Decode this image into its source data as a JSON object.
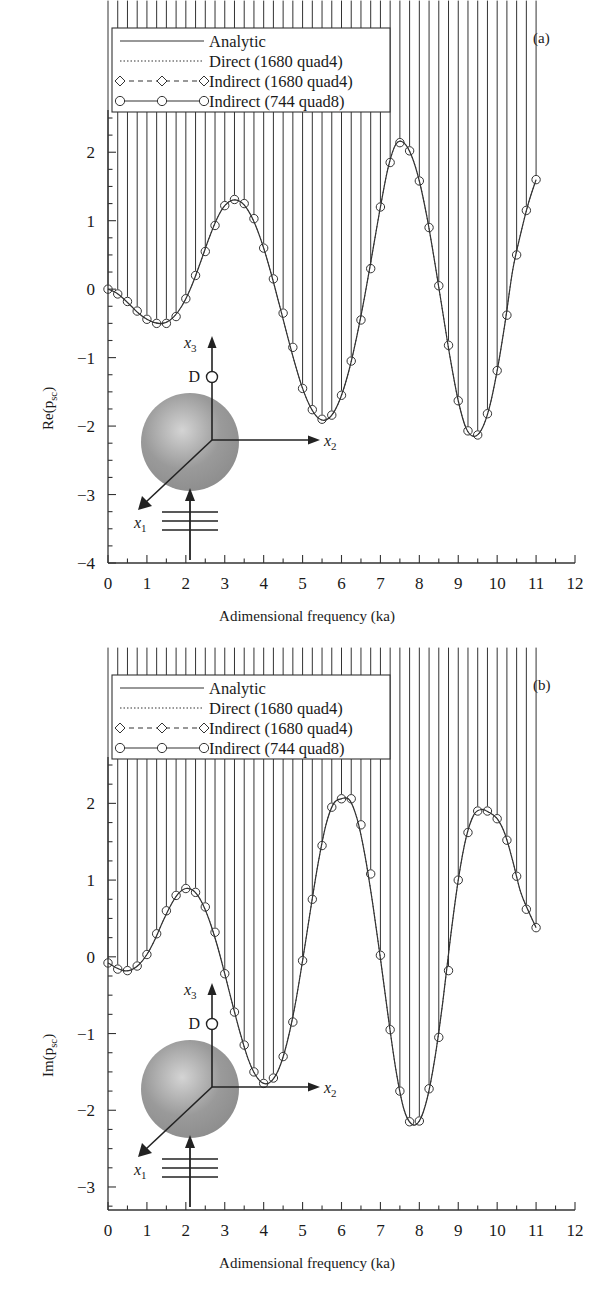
{
  "figure": {
    "panels": [
      {
        "id": "a",
        "label": "(a)",
        "ylabel_prefix": "Re(p",
        "ylabel_sub": "sc",
        "ylabel_suffix": ")",
        "xlabel": "Adimensional frequency (ka)"
      },
      {
        "id": "b",
        "label": "(b)",
        "ylabel_prefix": "Im(p",
        "ylabel_sub": "sc",
        "ylabel_suffix": ")",
        "xlabel": "Adimensional frequency (ka)"
      }
    ]
  },
  "legend": {
    "entries": [
      {
        "label": "Analytic",
        "style": "solid",
        "marker": "none",
        "color": "#333333"
      },
      {
        "label": "Direct (1680 quad4)",
        "style": "dotted",
        "marker": "none",
        "color": "#333333"
      },
      {
        "label": "Indirect (1680 quad4)",
        "style": "dashed",
        "marker": "diamond",
        "color": "#333333"
      },
      {
        "label": "Indirect (744 quad8)",
        "style": "solid",
        "marker": "circle",
        "color": "#333333"
      }
    ]
  },
  "inset": {
    "axis_x1_prefix": "x",
    "axis_x1_sub": "1",
    "axis_x2_prefix": "x",
    "axis_x2_sub": "2",
    "axis_x3_prefix": "x",
    "axis_x3_sub": "3",
    "point_label": "D",
    "sphere_fill": "#9a9a9a",
    "sphere_highlight": "#d4d4d4"
  },
  "chart_data": [
    {
      "type": "line",
      "panel": "a",
      "title": "",
      "xlabel": "Adimensional frequency (ka)",
      "ylabel": "Re(p_sc)",
      "xlim": [
        0,
        12
      ],
      "ylim": [
        -4,
        2.5
      ],
      "xticks": [
        0,
        1,
        2,
        3,
        4,
        5,
        6,
        7,
        8,
        9,
        10,
        11,
        12
      ],
      "yticks": [
        2,
        1,
        0,
        -1,
        -2,
        -3,
        -4
      ],
      "minor_tick_x": 0.5,
      "minor_tick_y": 0.25,
      "grid": false,
      "legend_position": "top-left",
      "series": [
        {
          "name": "Analytic",
          "x": [
            0,
            0.2,
            0.4,
            0.6,
            0.8,
            1.0,
            1.2,
            1.4,
            1.6,
            1.8,
            2.0,
            2.2,
            2.4,
            2.6,
            2.8,
            3.0,
            3.2,
            3.4,
            3.6,
            3.8,
            4.0,
            4.2,
            4.4,
            4.6,
            4.8,
            5.0,
            5.2,
            5.4,
            5.6,
            5.8,
            6.0,
            6.2,
            6.4,
            6.6,
            6.8,
            7.0,
            7.2,
            7.4,
            7.6,
            7.8,
            8.0,
            8.2,
            8.4,
            8.6,
            8.8,
            9.0,
            9.2,
            9.4,
            9.6,
            9.8,
            10.0,
            10.2,
            10.4,
            10.6,
            10.8,
            11.0
          ],
          "y": [
            0.0,
            -0.05,
            -0.14,
            -0.25,
            -0.36,
            -0.44,
            -0.49,
            -0.5,
            -0.45,
            -0.33,
            -0.14,
            0.12,
            0.43,
            0.75,
            1.03,
            1.22,
            1.3,
            1.28,
            1.15,
            0.92,
            0.6,
            0.21,
            -0.22,
            -0.66,
            -1.08,
            -1.45,
            -1.72,
            -1.88,
            -1.91,
            -1.8,
            -1.55,
            -1.17,
            -0.67,
            -0.09,
            0.55,
            1.2,
            1.78,
            2.12,
            2.14,
            1.95,
            1.58,
            1.04,
            0.38,
            -0.33,
            -1.03,
            -1.63,
            -2.03,
            -2.15,
            -2.05,
            -1.73,
            -1.19,
            -0.5,
            0.28,
            0.8,
            1.25,
            1.6
          ]
        },
        {
          "name": "Indirect (1680 quad4)",
          "marker": "diamond",
          "x": [
            0,
            0.25,
            0.5,
            0.75,
            1.0,
            1.25,
            1.5,
            1.75,
            2.0,
            2.25,
            2.5,
            2.75,
            3.0,
            3.25,
            3.5,
            3.75,
            4.0,
            4.25,
            4.5,
            4.75,
            5.0,
            5.25,
            5.5,
            5.75,
            6.0,
            6.25,
            6.5,
            6.75,
            7.0,
            7.25,
            7.5,
            7.75,
            8.0,
            8.25,
            8.5,
            8.75,
            9.0,
            9.25,
            9.5,
            9.75,
            10.0,
            10.25,
            10.5,
            10.75,
            11.0
          ],
          "y": [
            0.0,
            -0.07,
            -0.18,
            -0.32,
            -0.44,
            -0.5,
            -0.5,
            -0.4,
            -0.14,
            0.2,
            0.55,
            0.93,
            1.22,
            1.31,
            1.25,
            1.03,
            0.6,
            0.15,
            -0.35,
            -0.85,
            -1.45,
            -1.76,
            -1.9,
            -1.84,
            -1.55,
            -1.05,
            -0.45,
            0.3,
            1.2,
            1.85,
            2.14,
            2.02,
            1.58,
            0.9,
            0.05,
            -0.82,
            -1.63,
            -2.07,
            -2.13,
            -1.82,
            -1.19,
            -0.38,
            0.5,
            1.15,
            1.6
          ]
        },
        {
          "name": "Indirect (744 quad8)",
          "marker": "circle",
          "x": [
            0,
            0.25,
            0.5,
            0.75,
            1.0,
            1.25,
            1.5,
            1.75,
            2.0,
            2.25,
            2.5,
            2.75,
            3.0,
            3.25,
            3.5,
            3.75,
            4.0,
            4.25,
            4.5,
            4.75,
            5.0,
            5.25,
            5.5,
            5.75,
            6.0,
            6.25,
            6.5,
            6.75,
            7.0,
            7.25,
            7.5,
            7.75,
            8.0,
            8.25,
            8.5,
            8.75,
            9.0,
            9.25,
            9.5,
            9.75,
            10.0,
            10.25,
            10.5,
            10.75,
            11.0
          ],
          "y": [
            0.0,
            -0.07,
            -0.18,
            -0.32,
            -0.44,
            -0.5,
            -0.5,
            -0.4,
            -0.14,
            0.2,
            0.55,
            0.93,
            1.22,
            1.31,
            1.25,
            1.03,
            0.6,
            0.15,
            -0.35,
            -0.85,
            -1.45,
            -1.76,
            -1.9,
            -1.84,
            -1.55,
            -1.05,
            -0.45,
            0.3,
            1.2,
            1.85,
            2.14,
            2.02,
            1.58,
            0.9,
            0.05,
            -0.82,
            -1.63,
            -2.07,
            -2.13,
            -1.82,
            -1.19,
            -0.38,
            0.5,
            1.15,
            1.6
          ]
        }
      ]
    },
    {
      "type": "line",
      "panel": "b",
      "title": "",
      "xlabel": "Adimensional frequency (ka)",
      "ylabel": "Im(p_sc)",
      "xlim": [
        0,
        12
      ],
      "ylim": [
        -3.3,
        2.5
      ],
      "xticks": [
        0,
        1,
        2,
        3,
        4,
        5,
        6,
        7,
        8,
        9,
        10,
        11,
        12
      ],
      "yticks": [
        2,
        1,
        0,
        -1,
        -2,
        -3
      ],
      "minor_tick_x": 0.5,
      "minor_tick_y": 0.25,
      "grid": false,
      "legend_position": "top-left",
      "series": [
        {
          "name": "Analytic",
          "x": [
            0,
            0.2,
            0.4,
            0.6,
            0.8,
            1.0,
            1.2,
            1.4,
            1.6,
            1.8,
            2.0,
            2.2,
            2.4,
            2.6,
            2.8,
            3.0,
            3.2,
            3.4,
            3.6,
            3.8,
            4.0,
            4.2,
            4.4,
            4.6,
            4.8,
            5.0,
            5.2,
            5.4,
            5.6,
            5.8,
            6.0,
            6.2,
            6.4,
            6.6,
            6.8,
            7.0,
            7.2,
            7.4,
            7.6,
            7.8,
            8.0,
            8.2,
            8.4,
            8.6,
            8.8,
            9.0,
            9.2,
            9.4,
            9.6,
            9.8,
            10.0,
            10.2,
            10.4,
            10.6,
            10.8,
            11.0
          ],
          "y": [
            -0.08,
            -0.14,
            -0.18,
            -0.17,
            -0.1,
            0.03,
            0.22,
            0.45,
            0.66,
            0.82,
            0.89,
            0.86,
            0.72,
            0.48,
            0.16,
            -0.22,
            -0.62,
            -1.0,
            -1.33,
            -1.55,
            -1.65,
            -1.62,
            -1.45,
            -1.12,
            -0.65,
            -0.05,
            0.6,
            1.22,
            1.72,
            2.0,
            2.06,
            2.05,
            1.8,
            1.33,
            0.7,
            -0.02,
            -0.78,
            -1.48,
            -1.98,
            -2.18,
            -2.14,
            -1.85,
            -1.32,
            -0.6,
            0.25,
            1.0,
            1.55,
            1.85,
            1.92,
            1.88,
            1.8,
            1.6,
            1.25,
            0.85,
            0.6,
            0.38
          ]
        },
        {
          "name": "Indirect (1680 quad4)",
          "marker": "diamond",
          "x": [
            0,
            0.25,
            0.5,
            0.75,
            1.0,
            1.25,
            1.5,
            1.75,
            2.0,
            2.25,
            2.5,
            2.75,
            3.0,
            3.25,
            3.5,
            3.75,
            4.0,
            4.25,
            4.5,
            4.75,
            5.0,
            5.25,
            5.5,
            5.75,
            6.0,
            6.25,
            6.5,
            6.75,
            7.0,
            7.25,
            7.5,
            7.75,
            8.0,
            8.25,
            8.5,
            8.75,
            9.0,
            9.25,
            9.5,
            9.75,
            10.0,
            10.25,
            10.5,
            10.75,
            11.0
          ],
          "y": [
            -0.08,
            -0.16,
            -0.18,
            -0.12,
            0.03,
            0.3,
            0.6,
            0.8,
            0.89,
            0.84,
            0.65,
            0.32,
            -0.22,
            -0.72,
            -1.15,
            -1.5,
            -1.65,
            -1.58,
            -1.3,
            -0.85,
            -0.05,
            0.75,
            1.45,
            1.95,
            2.06,
            2.06,
            1.72,
            1.08,
            0.02,
            -0.95,
            -1.75,
            -2.15,
            -2.14,
            -1.72,
            -1.05,
            -0.18,
            1.0,
            1.62,
            1.9,
            1.9,
            1.8,
            1.52,
            1.05,
            0.62,
            0.38
          ]
        },
        {
          "name": "Indirect (744 quad8)",
          "marker": "circle",
          "x": [
            0,
            0.25,
            0.5,
            0.75,
            1.0,
            1.25,
            1.5,
            1.75,
            2.0,
            2.25,
            2.5,
            2.75,
            3.0,
            3.25,
            3.5,
            3.75,
            4.0,
            4.25,
            4.5,
            4.75,
            5.0,
            5.25,
            5.5,
            5.75,
            6.0,
            6.25,
            6.5,
            6.75,
            7.0,
            7.25,
            7.5,
            7.75,
            8.0,
            8.25,
            8.5,
            8.75,
            9.0,
            9.25,
            9.5,
            9.75,
            10.0,
            10.25,
            10.5,
            10.75,
            11.0
          ],
          "y": [
            -0.08,
            -0.16,
            -0.18,
            -0.12,
            0.03,
            0.3,
            0.6,
            0.8,
            0.89,
            0.84,
            0.65,
            0.32,
            -0.22,
            -0.72,
            -1.15,
            -1.5,
            -1.65,
            -1.58,
            -1.3,
            -0.85,
            -0.05,
            0.75,
            1.45,
            1.95,
            2.06,
            2.06,
            1.72,
            1.08,
            0.02,
            -0.95,
            -1.75,
            -2.15,
            -2.14,
            -1.72,
            -1.05,
            -0.18,
            1.0,
            1.62,
            1.9,
            1.9,
            1.8,
            1.52,
            1.05,
            0.62,
            0.38
          ]
        }
      ]
    }
  ]
}
